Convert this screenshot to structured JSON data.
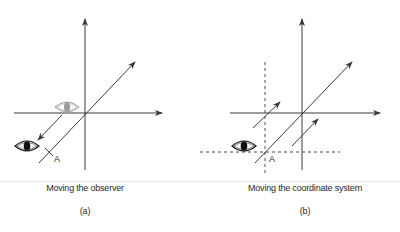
{
  "figure": {
    "panels": [
      {
        "id": "a",
        "caption": "Moving the observer",
        "label": "(a)",
        "point_label": "A",
        "elements": [
          "x-axis",
          "y-axis",
          "diagonal-axis",
          "observer-eye-original (gray)",
          "observer-eye-moved (black)",
          "movement-arrow"
        ]
      },
      {
        "id": "b",
        "caption": "Moving the coordinate system",
        "label": "(b)",
        "point_label": "A",
        "elements": [
          "x-axis",
          "y-axis",
          "diagonal-axis",
          "dashed-x-axis",
          "dashed-y-axis",
          "movement-arrow-1",
          "movement-arrow-2",
          "observer-eye (black)"
        ]
      }
    ],
    "colors": {
      "line": "#3a3a3a",
      "eye_gray": "#9a9a9a",
      "eye_black": "#111111",
      "background": "#ffffff"
    }
  }
}
